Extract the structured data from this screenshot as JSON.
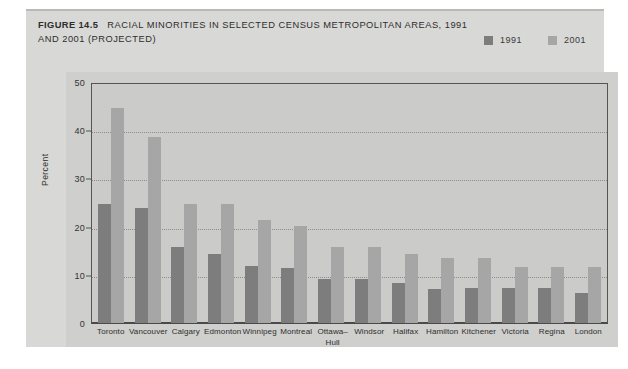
{
  "figure": {
    "number": "FIGURE 14.5",
    "title": "RACIAL MINORITIES IN SELECTED CENSUS METROPOLITAN AREAS, 1991 AND 2001 (PROJECTED)"
  },
  "legend": {
    "items": [
      {
        "label": "1991",
        "color": "#7d7d7d"
      },
      {
        "label": "2001",
        "color": "#a6a6a6"
      }
    ]
  },
  "colors": {
    "series_1991": "#7d7d7d",
    "series_2001": "#a6a6a6",
    "card_background": "#d8d8d6",
    "plot_background": "#cfcfcd",
    "axes_background": "#cbcbc9",
    "axis_line": "#555553",
    "gridline": "#8c8c8a",
    "text": "#2d2d2d"
  },
  "chart_data": {
    "type": "bar",
    "title": "RACIAL MINORITIES IN SELECTED CENSUS METROPOLITAN AREAS, 1991 AND 2001 (PROJECTED)",
    "xlabel": "",
    "ylabel": "Percent",
    "ylim": [
      0,
      50
    ],
    "yticks": [
      0,
      10,
      20,
      30,
      40,
      50
    ],
    "grid": true,
    "legend_position": "top-right",
    "categories": [
      "Toronto",
      "Vancouver",
      "Calgary",
      "Edmonton",
      "Winnipeg",
      "Montreal",
      "Ottawa–Hull",
      "Windsor",
      "Halifax",
      "Hamilton",
      "Kitchener",
      "Victoria",
      "Regina",
      "London"
    ],
    "series": [
      {
        "name": "1991",
        "color": "#7d7d7d",
        "values": [
          25,
          24,
          16,
          14.5,
          12,
          11.5,
          9.3,
          9.3,
          8.3,
          7.2,
          7.4,
          7.3,
          7.3,
          6.2
        ]
      },
      {
        "name": "2001",
        "color": "#a6a6a6",
        "values": [
          45,
          39,
          25,
          25,
          21.5,
          20.2,
          16,
          16,
          14.5,
          13.5,
          13.5,
          11.8,
          11.8,
          11.8
        ]
      }
    ]
  },
  "axis": {
    "y_tick_labels": [
      "50",
      "40",
      "30",
      "20",
      "10",
      "0"
    ]
  },
  "x_labels": [
    [
      "Toronto"
    ],
    [
      "Vancouver"
    ],
    [
      "Calgary"
    ],
    [
      "Edmonton"
    ],
    [
      "Winnipeg"
    ],
    [
      "Montreal"
    ],
    [
      "Ottawa–",
      "Hull"
    ],
    [
      "Windsor"
    ],
    [
      "Halifax"
    ],
    [
      "Hamilton"
    ],
    [
      "Kitchener"
    ],
    [
      "Victoria"
    ],
    [
      "Regina"
    ],
    [
      "London"
    ]
  ]
}
